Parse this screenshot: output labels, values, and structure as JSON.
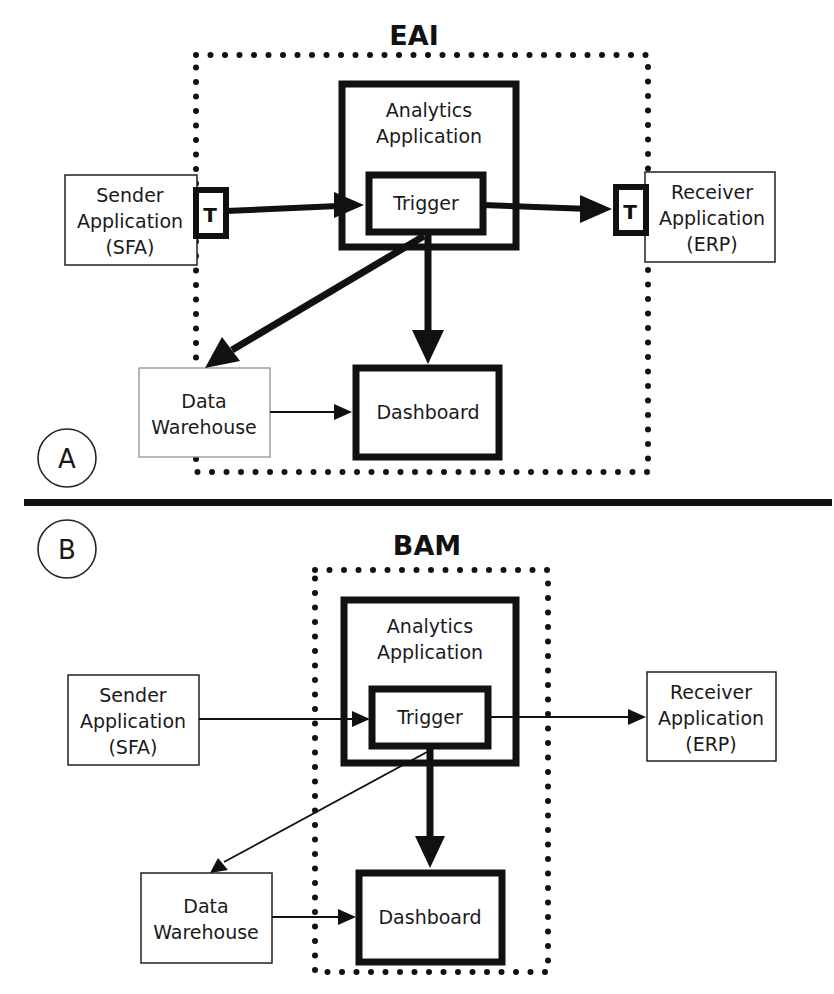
{
  "colors": {
    "ink": "#111111",
    "background": "#ffffff"
  },
  "panel_a": {
    "marker": "A",
    "title": "EAI",
    "sender": {
      "line1": "Sender",
      "line2": "Application",
      "line3": "(SFA)"
    },
    "receiver": {
      "line1": "Receiver",
      "line2": "Application",
      "line3": "(ERP)"
    },
    "analytics": {
      "line1": "Analytics",
      "line2": "Application"
    },
    "trigger": "Trigger",
    "adapter_left": "T",
    "adapter_right": "T",
    "warehouse": {
      "line1": "Data",
      "line2": "Warehouse"
    },
    "dashboard": "Dashboard"
  },
  "panel_b": {
    "marker": "B",
    "title": "BAM",
    "sender": {
      "line1": "Sender",
      "line2": "Application",
      "line3": "(SFA)"
    },
    "receiver": {
      "line1": "Receiver",
      "line2": "Application",
      "line3": "(ERP)"
    },
    "analytics": {
      "line1": "Analytics",
      "line2": "Application"
    },
    "trigger": "Trigger",
    "warehouse": {
      "line1": "Data",
      "line2": "Warehouse"
    },
    "dashboard": "Dashboard"
  }
}
